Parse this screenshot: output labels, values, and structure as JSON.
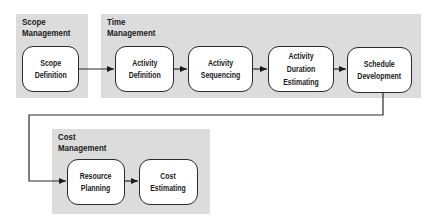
{
  "groups": {
    "scope": {
      "title_line1": "Scope",
      "title_line2": "Management",
      "nodes": [
        {
          "line1": "Scope",
          "line2": "Definition"
        }
      ]
    },
    "time": {
      "title_line1": "Time",
      "title_line2": "Management",
      "nodes": [
        {
          "line1": "Activity",
          "line2": "Definition"
        },
        {
          "line1": "Activity",
          "line2": "Sequencing"
        },
        {
          "line1": "Activity",
          "line2": "Duration",
          "line3": "Estimating"
        },
        {
          "line1": "Schedule",
          "line2": "Development"
        }
      ]
    },
    "cost": {
      "title_line1": "Cost",
      "title_line2": "Management",
      "nodes": [
        {
          "line1": "Resource",
          "line2": "Planning"
        },
        {
          "line1": "Cost",
          "line2": "Estimating"
        }
      ]
    }
  },
  "edges": [
    {
      "from": "Scope Definition",
      "to": "Activity Definition"
    },
    {
      "from": "Activity Definition",
      "to": "Activity Sequencing"
    },
    {
      "from": "Activity Sequencing",
      "to": "Activity Duration Estimating"
    },
    {
      "from": "Activity Duration Estimating",
      "to": "Schedule Development"
    },
    {
      "from": "Schedule Development",
      "to": "Resource Planning"
    },
    {
      "from": "Resource Planning",
      "to": "Cost Estimating"
    }
  ],
  "colors": {
    "panel_fill": "#dcdcdc",
    "node_fill": "#ffffff",
    "stroke": "#2a2a2a"
  }
}
